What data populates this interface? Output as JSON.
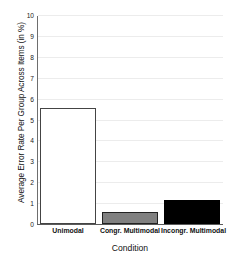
{
  "chart_data": {
    "type": "bar",
    "title": "",
    "categories": [
      "Unimodal",
      "Congr. Multimodal",
      "Incongr. Multimodal"
    ],
    "values": [
      5.55,
      0.58,
      1.15
    ],
    "bar_colors": [
      "#ffffff",
      "#808080",
      "#000000"
    ],
    "bar_edge_colors": [
      "#444444",
      "#222222",
      "#000000"
    ],
    "xlabel": "Condition",
    "ylabel": "Average Error Rate Per Group Across Items (in %)",
    "ylim": [
      0,
      10
    ],
    "ytick_labels": [
      "0",
      "1",
      "2",
      "3",
      "4",
      "5",
      "6",
      "7",
      "8",
      "9",
      "10"
    ],
    "ytick_values": [
      0,
      1,
      2,
      3,
      4,
      5,
      6,
      7,
      8,
      9,
      10
    ],
    "grid": true,
    "grid_axis": "y",
    "legend": false,
    "legend_position": "none",
    "background_color": "#ffffff",
    "axis_color": "#5a5a5a",
    "gridline_color": "#ececec"
  }
}
